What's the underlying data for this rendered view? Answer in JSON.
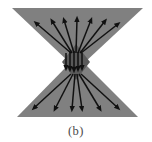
{
  "figure": {
    "caption": "(b)",
    "label": "b",
    "colors": {
      "background": "#ffffff",
      "body_fill": "#808080",
      "core_fill": "#5a5a5a",
      "arrow_stroke": "#111111",
      "caption_text": "#4a4a4a"
    },
    "shape": {
      "type": "bowtie",
      "top_left": [
        12,
        8
      ],
      "top_right": [
        143,
        8
      ],
      "waist_left": [
        70,
        63
      ],
      "waist_right": [
        84,
        63
      ],
      "bottom_left": [
        17,
        117
      ],
      "bottom_right": [
        138,
        117
      ]
    },
    "core": {
      "type": "diamond",
      "center": [
        76,
        62
      ],
      "half_width": 14,
      "half_height": 18
    }
  },
  "chart_data": {
    "type": "scatter",
    "xlabel": "",
    "ylabel": "",
    "grid": false,
    "legend": null,
    "annotations": [
      "(b)"
    ],
    "series": [
      {
        "name": "upper-fan-arrows",
        "direction": "outward-up",
        "count": 7,
        "arrows": [
          {
            "x1": 71,
            "y1": 53,
            "x2": 36,
            "y2": 23
          },
          {
            "x1": 72,
            "y1": 53,
            "x2": 52,
            "y2": 21
          },
          {
            "x1": 74,
            "y1": 53,
            "x2": 64,
            "y2": 20
          },
          {
            "x1": 76,
            "y1": 53,
            "x2": 77,
            "y2": 19
          },
          {
            "x1": 78,
            "y1": 53,
            "x2": 91,
            "y2": 20
          },
          {
            "x1": 80,
            "y1": 53,
            "x2": 105,
            "y2": 21
          },
          {
            "x1": 81,
            "y1": 53,
            "x2": 118,
            "y2": 24
          }
        ]
      },
      {
        "name": "core-arrows",
        "direction": "downward",
        "count": 5,
        "arrows": [
          {
            "x1": 66,
            "y1": 53,
            "x2": 66,
            "y2": 68
          },
          {
            "x1": 70,
            "y1": 52,
            "x2": 70,
            "y2": 69
          },
          {
            "x1": 74,
            "y1": 51,
            "x2": 74,
            "y2": 70
          },
          {
            "x1": 78,
            "y1": 52,
            "x2": 78,
            "y2": 69
          },
          {
            "x1": 82,
            "y1": 53,
            "x2": 82,
            "y2": 68
          }
        ]
      },
      {
        "name": "lower-fan-arrows",
        "direction": "outward-down",
        "count": 6,
        "arrows": [
          {
            "x1": 71,
            "y1": 74,
            "x2": 34,
            "y2": 108
          },
          {
            "x1": 73,
            "y1": 74,
            "x2": 55,
            "y2": 109
          },
          {
            "x1": 75,
            "y1": 74,
            "x2": 72,
            "y2": 109
          },
          {
            "x1": 77,
            "y1": 74,
            "x2": 82,
            "y2": 109
          },
          {
            "x1": 79,
            "y1": 74,
            "x2": 100,
            "y2": 109
          },
          {
            "x1": 81,
            "y1": 74,
            "x2": 118,
            "y2": 108
          }
        ]
      }
    ]
  }
}
